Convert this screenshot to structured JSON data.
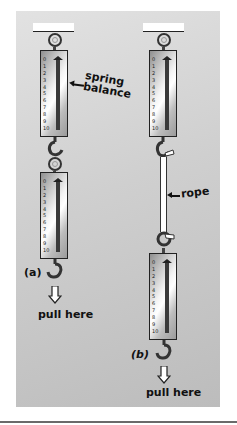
{
  "figure": {
    "panel_color": "#cccccc",
    "scale_ticks": [
      "0",
      "1",
      "2",
      "3",
      "4",
      "5",
      "6",
      "7",
      "8",
      "9",
      "10"
    ],
    "part_a": {
      "label": "(a)",
      "balance_label_line1": "spring",
      "balance_label_line2": "balance",
      "pull_label": "pull here"
    },
    "part_b": {
      "label": "(b)",
      "rope_label": "rope",
      "pull_label": "pull here"
    }
  }
}
